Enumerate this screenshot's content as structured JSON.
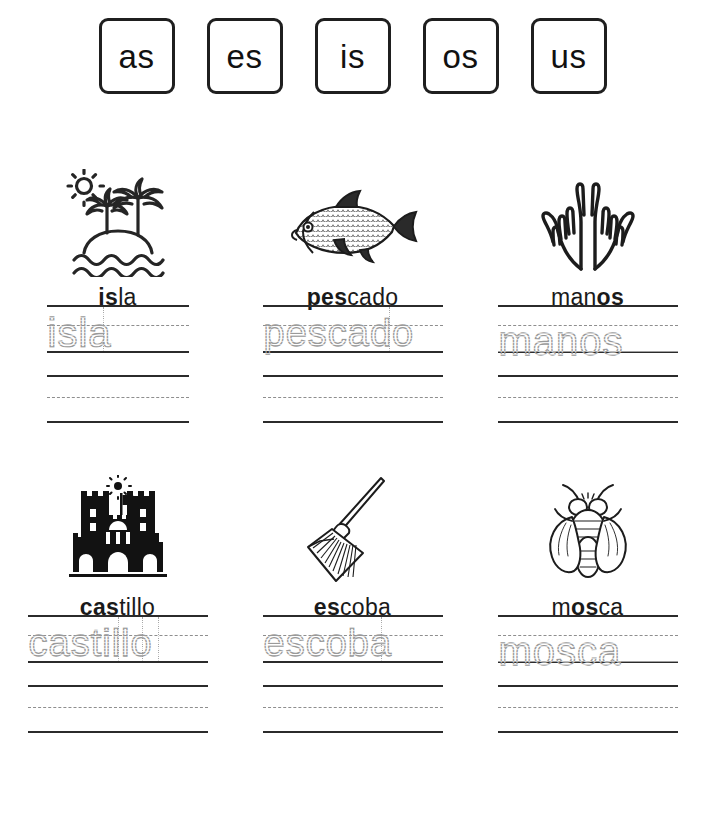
{
  "header": {
    "syllables": [
      {
        "text": "as"
      },
      {
        "text": "es"
      },
      {
        "text": "is"
      },
      {
        "text": "os"
      },
      {
        "text": "us"
      }
    ]
  },
  "worksheet": {
    "items": [
      {
        "word": "isla",
        "bold_part": "is",
        "rest_part": "la",
        "icon": "island-palm-trees-icon",
        "trace_text": "isla"
      },
      {
        "word": "pescado",
        "bold_part": "pes",
        "rest_part": "cado",
        "icon": "fish-icon",
        "trace_text": "pescado"
      },
      {
        "word": "manos",
        "bold_part": "man",
        "rest_part": "os",
        "bold_first": false,
        "icon": "open-hands-icon",
        "trace_text": "manos"
      },
      {
        "word": "castillo",
        "bold_part": "cas",
        "rest_part": "tillo",
        "icon": "castle-icon",
        "trace_text": "castillo"
      },
      {
        "word": "escoba",
        "bold_part": "es",
        "rest_part": "coba",
        "icon": "broom-icon",
        "trace_text": "escoba"
      },
      {
        "word": "mosca",
        "bold_part": "os",
        "rest_part": "ca",
        "prefix_part": "m",
        "icon": "fly-icon",
        "trace_text": "mosca"
      }
    ]
  },
  "colors": {
    "ink": "#1a1a1a",
    "line": "#2b2b2b",
    "dashed": "#8e8e8e",
    "trace": "#9a9a9a",
    "background": "#ffffff"
  }
}
